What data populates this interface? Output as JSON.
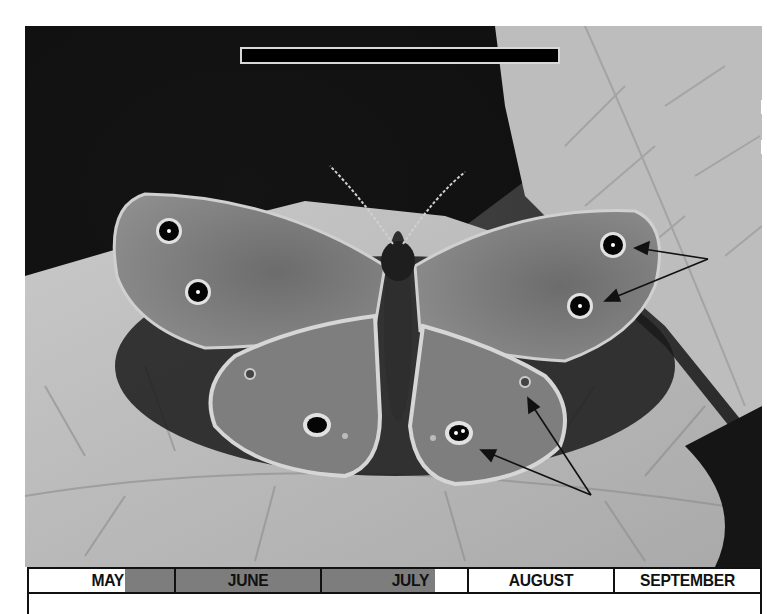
{
  "figure": {
    "title_bar_label": "",
    "photo_description": "Black-and-white photograph of a butterfly with eyespots, wings spread on a leaf",
    "annotations": {
      "upper_right_arrows": 2,
      "lower_right_arrows": 2
    }
  },
  "timeline": {
    "months": [
      {
        "label": "MAY",
        "highlight": "partial-end"
      },
      {
        "label": "JUNE",
        "highlight": "full"
      },
      {
        "label": "JULY",
        "highlight": "partial-start"
      },
      {
        "label": "AUGUST",
        "highlight": "none"
      },
      {
        "label": "SEPTEMBER",
        "highlight": "none"
      }
    ],
    "highlight_color": "#7d7d7d",
    "background_color": "#ffffff",
    "border_color": "#111111"
  }
}
